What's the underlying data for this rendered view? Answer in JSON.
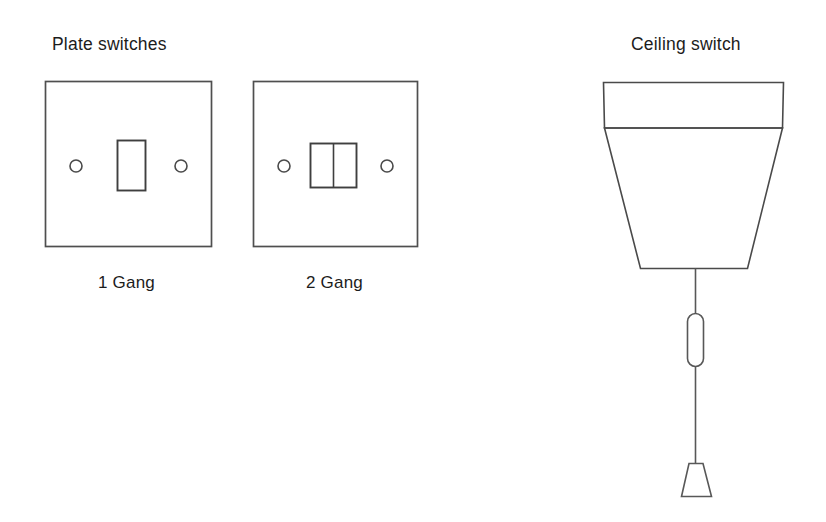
{
  "page": {
    "background_color": "#ffffff",
    "line_color": "#4a4a4a",
    "text_color": "#1c1c1c",
    "width": 826,
    "height": 522
  },
  "headings": {
    "plate_switches": "Plate switches",
    "ceiling_switch": "Ceiling switch"
  },
  "plate_switches": {
    "items": [
      {
        "caption": "1 Gang",
        "gang_count": 1,
        "screw_holes": 2,
        "rocker_count": 1
      },
      {
        "caption": "2 Gang",
        "gang_count": 2,
        "screw_holes": 2,
        "rocker_count": 2
      }
    ]
  },
  "ceiling_switch": {
    "parts": [
      "ceiling-mount-band",
      "tapered-body",
      "pull-cord",
      "cord-bead",
      "pull-handle"
    ]
  }
}
